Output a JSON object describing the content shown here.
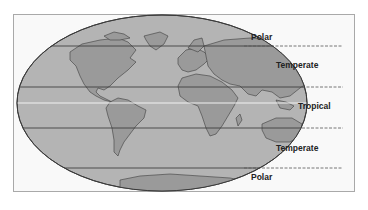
{
  "diagram": {
    "title": "",
    "type": "world map with climate zone bands",
    "zones": [
      {
        "id": "polar-north",
        "label": "Polar"
      },
      {
        "id": "temperate-north",
        "label": "Temperate"
      },
      {
        "id": "tropical",
        "label": "Tropical"
      },
      {
        "id": "temperate-south",
        "label": "Temperate"
      },
      {
        "id": "polar-south",
        "label": "Polar"
      }
    ],
    "colors": {
      "ocean": "#b4b4b4",
      "land": "#999999",
      "outline": "#444444",
      "equator": "#f0f0f0",
      "background": "#f9f9f9"
    }
  }
}
